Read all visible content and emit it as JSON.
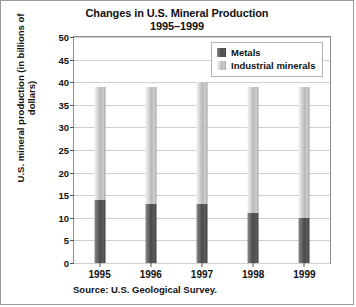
{
  "chart_data": {
    "type": "bar",
    "subtype": "stacked",
    "title": "Changes in U.S. Mineral Production",
    "subtitle": "1995–1999",
    "xlabel": "",
    "ylabel": "U.S. mineral production (in billions of dollars)",
    "ylim": [
      0,
      50
    ],
    "yticks": [
      0,
      5,
      10,
      15,
      20,
      25,
      30,
      35,
      40,
      45,
      50
    ],
    "grid": true,
    "legend_position": "top-right",
    "categories": [
      "1995",
      "1996",
      "1997",
      "1998",
      "1999"
    ],
    "series": [
      {
        "name": "Metals",
        "values": [
          14,
          13,
          13,
          11,
          10
        ],
        "color": "#4a4a4a"
      },
      {
        "name": "Industrial minerals",
        "values": [
          25,
          26,
          27,
          28,
          29
        ],
        "color": "#b9b9b9"
      }
    ],
    "totals": [
      39,
      39,
      40,
      39,
      39
    ],
    "source": "Source: U.S. Geological Survey."
  },
  "legend": {
    "items": [
      {
        "label": "Metals"
      },
      {
        "label": "Industrial minerals"
      }
    ]
  }
}
